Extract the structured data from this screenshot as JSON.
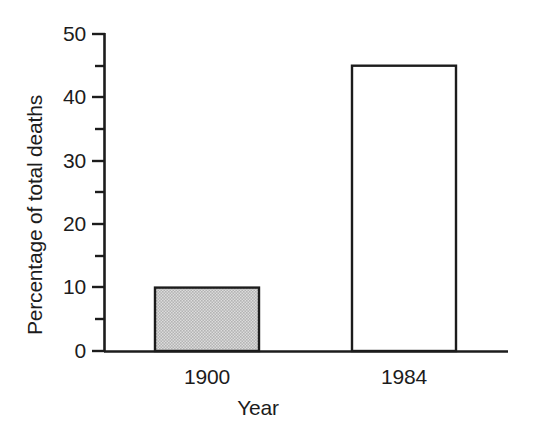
{
  "chart_data": {
    "type": "bar",
    "title": "",
    "subtitle": "",
    "xlabel": "Year",
    "ylabel": "Percentage of total deaths",
    "categories": [
      "1900",
      "1984"
    ],
    "values": [
      10,
      45
    ],
    "series": [
      {
        "name": "Percentage of total deaths",
        "values": [
          10,
          45
        ]
      }
    ],
    "ylim": [
      0,
      50
    ],
    "y_major_ticks": [
      0,
      10,
      20,
      30,
      40,
      50
    ],
    "y_major_tick_labels": [
      "0",
      "10",
      "20",
      "30",
      "40",
      "50"
    ],
    "y_minor_ticks": [
      5,
      15,
      25,
      35,
      45
    ],
    "grid": false,
    "legend": false,
    "legend_position": "none",
    "bar_styles": [
      {
        "category": "1900",
        "fill": "#c9c9c9",
        "stroke": "#1c1c1c",
        "pattern": "halftone-gray"
      },
      {
        "category": "1984",
        "fill": "#ffffff",
        "stroke": "#1c1c1c",
        "pattern": "none"
      }
    ],
    "annotations": [],
    "background": "#ffffff",
    "tick_direction": "out"
  }
}
